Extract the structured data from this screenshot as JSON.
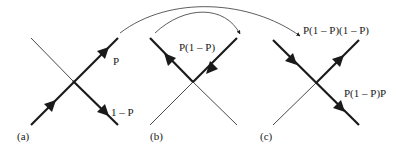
{
  "figure": {
    "panels": [
      {
        "id": "a",
        "caption": "(a)",
        "labels": {
          "upper_right": "P",
          "lower_right": "1 – P"
        }
      },
      {
        "id": "b",
        "caption": "(b)",
        "labels": {
          "top": "P(1 – P)"
        }
      },
      {
        "id": "c",
        "caption": "(c)",
        "labels": {
          "upper_right": "P(1 – P)(1 – P)",
          "lower_right": "P(1 – P)P"
        }
      }
    ],
    "colors": {
      "line": "#1a1a1a",
      "background": "#ffffff"
    }
  }
}
